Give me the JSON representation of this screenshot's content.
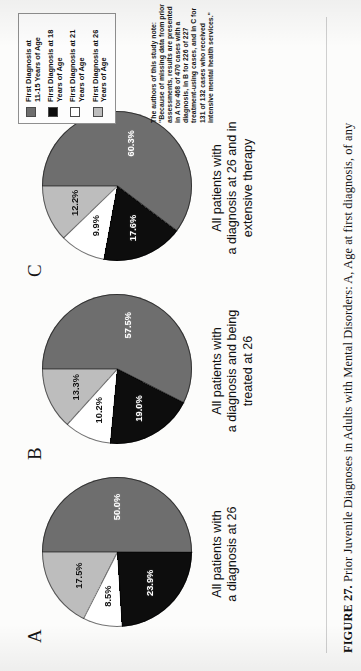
{
  "figure": {
    "caption_prefix": "FIGURE 27.",
    "caption_text": "Prior Juvenile Diagnoses in Adults with Mental Disorders: A, Age at first diagnosis, of any"
  },
  "legend": {
    "items": [
      {
        "label": "First Diagnosis at 11-15 Years of Age",
        "color": "#6e6e6e",
        "swatch_name": "legend-swatch-11-15"
      },
      {
        "label": "First Diagnosis at 18 Years of Age",
        "color": "#0d0d0d",
        "swatch_name": "legend-swatch-18"
      },
      {
        "label": "First Diagnosis at 21 Years of Age",
        "color": "#ffffff",
        "swatch_name": "legend-swatch-21"
      },
      {
        "label": "First Diagnosis at 26 Years of Age",
        "color": "#bdbdbd",
        "swatch_name": "legend-swatch-26"
      }
    ]
  },
  "note": {
    "text": "The authors of this study note: \"Because of missing data from prior assessments, results are presented in A for 468 of 470 cases with a diagnosis, in B for 226 of 227 treatment-using cases, and in C for 131 of 132 cases who received intensive mental health services.\""
  },
  "panels": {
    "a": {
      "letter": "A",
      "sublabel": "All patients with\na diagnosis at 26"
    },
    "b": {
      "letter": "B",
      "sublabel": "All patients with\na diagnosis and being\ntreated at 26"
    },
    "c": {
      "letter": "C",
      "sublabel": "All patients with\na diagnosis at 26 and in\nextensive therapy"
    }
  },
  "chart_data": [
    {
      "id": "A",
      "type": "pie",
      "title": "All patients with a diagnosis at 26",
      "categories": [
        "First Diagnosis at 11-15 Years of Age",
        "First Diagnosis at 18 Years of Age",
        "First Diagnosis at 21 Years of Age",
        "First Diagnosis at 26 Years of Age"
      ],
      "values": [
        50.0,
        23.9,
        8.5,
        17.5
      ],
      "labels": [
        "50.0%",
        "23.9%",
        "8.5%",
        "17.5%"
      ],
      "colors": [
        "#6e6e6e",
        "#0d0d0d",
        "#ffffff",
        "#bdbdbd"
      ],
      "n": "468 of 470 cases with a diagnosis"
    },
    {
      "id": "B",
      "type": "pie",
      "title": "All patients with a diagnosis and being treated at 26",
      "categories": [
        "First Diagnosis at 11-15 Years of Age",
        "First Diagnosis at 18 Years of Age",
        "First Diagnosis at 21 Years of Age",
        "First Diagnosis at 26 Years of Age"
      ],
      "values": [
        57.5,
        19.0,
        10.2,
        13.3
      ],
      "labels": [
        "57.5%",
        "19.0%",
        "10.2%",
        "13.3%"
      ],
      "colors": [
        "#6e6e6e",
        "#0d0d0d",
        "#ffffff",
        "#bdbdbd"
      ],
      "n": "226 of 227 treatment-using cases"
    },
    {
      "id": "C",
      "type": "pie",
      "title": "All patients with a diagnosis at 26 and in extensive therapy",
      "categories": [
        "First Diagnosis at 11-15 Years of Age",
        "First Diagnosis at 18 Years of Age",
        "First Diagnosis at 21 Years of Age",
        "First Diagnosis at 26 Years of Age"
      ],
      "values": [
        60.3,
        17.6,
        9.9,
        12.2
      ],
      "labels": [
        "60.3%",
        "17.6%",
        "9.9%",
        "12.2%"
      ],
      "colors": [
        "#6e6e6e",
        "#0d0d0d",
        "#ffffff",
        "#bdbdbd"
      ],
      "n": "131 of 132 cases who received intensive mental health services"
    }
  ]
}
